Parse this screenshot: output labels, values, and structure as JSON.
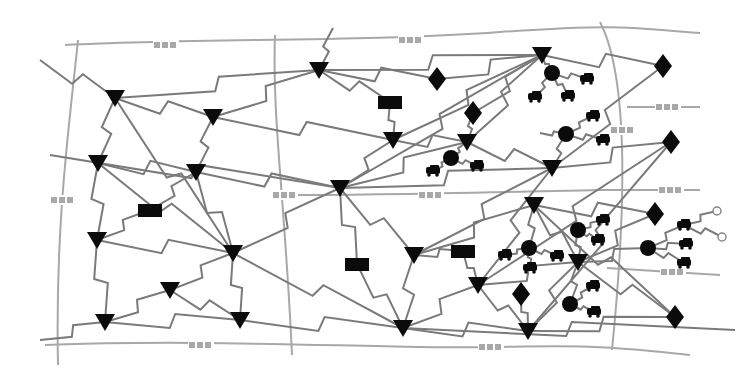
{
  "diagram": {
    "title": "",
    "colors": {
      "background": "#ffffff",
      "road": "#a8a8a8",
      "link": "#7a7a7a",
      "node": "#0b0b0b"
    },
    "legend_symbols": {
      "triangle": "router-node",
      "rectangle": "gateway-node",
      "diamond": "access-point-node",
      "circle": "cluster-head-node",
      "vehicle": "vehicle-node"
    },
    "roads": [
      {
        "id": "r-top",
        "path": "M65 45 C200 38, 360 42, 500 32 S 640 30, 700 33",
        "marks": [
          [
            165,
            45
          ],
          [
            410,
            40
          ]
        ]
      },
      {
        "id": "r-mid",
        "path": "M285 195 C380 195, 460 193, 600 190",
        "marks": [
          [
            430,
            195
          ]
        ]
      },
      {
        "id": "r-bottom",
        "path": "M45 345 C180 340, 300 345, 420 347 S 560 340, 690 355",
        "marks": [
          [
            200,
            345
          ],
          [
            490,
            347
          ]
        ]
      },
      {
        "id": "r-left",
        "path": "M78 40 C70 120, 55 220, 58 365",
        "marks": [
          [
            62,
            200
          ]
        ]
      },
      {
        "id": "r-centerleft",
        "path": "M275 35 C272 120, 285 200, 292 355",
        "marks": [
          [
            284,
            195
          ]
        ]
      },
      {
        "id": "r-right",
        "path": "M600 22 C630 80, 625 220, 612 350",
        "marks": [
          [
            622,
            130
          ]
        ]
      },
      {
        "id": "r-right-spur1",
        "path": "M627 107 L 700 107",
        "marks": [
          [
            667,
            107
          ]
        ]
      },
      {
        "id": "r-right-spur2",
        "path": "M600 190 L 700 190",
        "marks": [
          [
            670,
            190
          ]
        ]
      },
      {
        "id": "r-right-spur3",
        "path": "M607 268 L 720 275",
        "marks": [
          [
            672,
            272
          ]
        ]
      }
    ],
    "nodes": [
      {
        "id": "t1",
        "type": "triangle",
        "x": 115,
        "y": 98
      },
      {
        "id": "t2",
        "type": "triangle",
        "x": 213,
        "y": 117
      },
      {
        "id": "t3",
        "type": "triangle",
        "x": 98,
        "y": 163
      },
      {
        "id": "t4",
        "type": "triangle",
        "x": 196,
        "y": 172
      },
      {
        "id": "t5",
        "type": "triangle",
        "x": 97,
        "y": 240
      },
      {
        "id": "t6",
        "type": "triangle",
        "x": 233,
        "y": 253
      },
      {
        "id": "t7",
        "type": "triangle",
        "x": 170,
        "y": 290
      },
      {
        "id": "t8",
        "type": "triangle",
        "x": 105,
        "y": 322
      },
      {
        "id": "t9",
        "type": "triangle",
        "x": 240,
        "y": 320
      },
      {
        "id": "t10",
        "type": "triangle",
        "x": 319,
        "y": 70
      },
      {
        "id": "t11",
        "type": "triangle",
        "x": 393,
        "y": 140
      },
      {
        "id": "t12",
        "type": "triangle",
        "x": 340,
        "y": 188
      },
      {
        "id": "t13",
        "type": "triangle",
        "x": 542,
        "y": 55
      },
      {
        "id": "t14",
        "type": "triangle",
        "x": 467,
        "y": 142
      },
      {
        "id": "t15",
        "type": "triangle",
        "x": 552,
        "y": 168
      },
      {
        "id": "t16",
        "type": "triangle",
        "x": 534,
        "y": 205
      },
      {
        "id": "t17",
        "type": "triangle",
        "x": 414,
        "y": 255
      },
      {
        "id": "t18",
        "type": "triangle",
        "x": 478,
        "y": 285
      },
      {
        "id": "t19",
        "type": "triangle",
        "x": 403,
        "y": 328
      },
      {
        "id": "t20",
        "type": "triangle",
        "x": 578,
        "y": 262
      },
      {
        "id": "t21",
        "type": "triangle",
        "x": 528,
        "y": 331
      },
      {
        "id": "g1",
        "type": "rectangle",
        "x": 390,
        "y": 102
      },
      {
        "id": "g2",
        "type": "rectangle",
        "x": 150,
        "y": 210
      },
      {
        "id": "g3",
        "type": "rectangle",
        "x": 357,
        "y": 264
      },
      {
        "id": "g4",
        "type": "rectangle",
        "x": 463,
        "y": 251
      },
      {
        "id": "d1",
        "type": "diamond",
        "x": 437,
        "y": 79
      },
      {
        "id": "d2",
        "type": "diamond",
        "x": 473,
        "y": 113
      },
      {
        "id": "d3",
        "type": "diamond",
        "x": 663,
        "y": 66
      },
      {
        "id": "d4",
        "type": "diamond",
        "x": 671,
        "y": 142
      },
      {
        "id": "d5",
        "type": "diamond",
        "x": 655,
        "y": 214
      },
      {
        "id": "d6",
        "type": "diamond",
        "x": 521,
        "y": 294
      },
      {
        "id": "d7",
        "type": "diamond",
        "x": 675,
        "y": 317
      },
      {
        "id": "c1",
        "type": "circle",
        "x": 552,
        "y": 73
      },
      {
        "id": "c2",
        "type": "circle",
        "x": 451,
        "y": 158
      },
      {
        "id": "c3",
        "type": "circle",
        "x": 566,
        "y": 134
      },
      {
        "id": "c4",
        "type": "circle",
        "x": 529,
        "y": 248
      },
      {
        "id": "c5",
        "type": "circle",
        "x": 578,
        "y": 230
      },
      {
        "id": "c6",
        "type": "circle",
        "x": 648,
        "y": 248
      },
      {
        "id": "c7",
        "type": "circle",
        "x": 570,
        "y": 304
      },
      {
        "id": "v1",
        "type": "vehicle",
        "x": 587,
        "y": 79
      },
      {
        "id": "v2",
        "type": "vehicle",
        "x": 535,
        "y": 97
      },
      {
        "id": "v3",
        "type": "vehicle",
        "x": 568,
        "y": 96
      },
      {
        "id": "v4",
        "type": "vehicle",
        "x": 433,
        "y": 171
      },
      {
        "id": "v5",
        "type": "vehicle",
        "x": 477,
        "y": 166
      },
      {
        "id": "v6",
        "type": "vehicle",
        "x": 593,
        "y": 116
      },
      {
        "id": "v7",
        "type": "vehicle",
        "x": 603,
        "y": 140
      },
      {
        "id": "v8",
        "type": "vehicle",
        "x": 505,
        "y": 255
      },
      {
        "id": "v9",
        "type": "vehicle",
        "x": 557,
        "y": 256
      },
      {
        "id": "v10",
        "type": "vehicle",
        "x": 530,
        "y": 268
      },
      {
        "id": "v11",
        "type": "vehicle",
        "x": 603,
        "y": 220
      },
      {
        "id": "v12",
        "type": "vehicle",
        "x": 598,
        "y": 240
      },
      {
        "id": "v13",
        "type": "vehicle",
        "x": 684,
        "y": 225
      },
      {
        "id": "v14",
        "type": "vehicle",
        "x": 686,
        "y": 244
      },
      {
        "id": "v15",
        "type": "vehicle",
        "x": 684,
        "y": 263
      },
      {
        "id": "v16",
        "type": "vehicle",
        "x": 593,
        "y": 286
      },
      {
        "id": "v17",
        "type": "vehicle",
        "x": 594,
        "y": 312
      }
    ],
    "endpoints": [
      {
        "id": "e1",
        "x": 717,
        "y": 211
      },
      {
        "id": "e2",
        "x": 722,
        "y": 237
      }
    ],
    "links": [
      [
        "ext-a",
        "t1",
        40,
        60
      ],
      [
        "t1",
        "t10",
        0,
        0
      ],
      [
        "t1",
        "t2",
        0,
        0
      ],
      [
        "t1",
        "t3",
        0,
        0
      ],
      [
        "t1",
        "t6",
        0,
        0
      ],
      [
        "t2",
        "t10",
        0,
        0
      ],
      [
        "t2",
        "t4",
        0,
        0
      ],
      [
        "t2",
        "t11",
        0,
        0
      ],
      [
        "t3",
        "t4",
        0,
        0
      ],
      [
        "t3",
        "t5",
        0,
        0
      ],
      [
        "t3",
        "t6",
        0,
        0
      ],
      [
        "t4",
        "t6",
        0,
        0
      ],
      [
        "t4",
        "g2",
        0,
        0
      ],
      [
        "t4",
        "t12",
        0,
        0
      ],
      [
        "t5",
        "g2",
        0,
        0
      ],
      [
        "t5",
        "t6",
        0,
        0
      ],
      [
        "t5",
        "t8",
        0,
        0
      ],
      [
        "t6",
        "t7",
        0,
        0
      ],
      [
        "t6",
        "t9",
        0,
        0
      ],
      [
        "t6",
        "t12",
        0,
        0
      ],
      [
        "t6",
        "t19",
        0,
        0
      ],
      [
        "t7",
        "t8",
        0,
        0
      ],
      [
        "t7",
        "t9",
        0,
        0
      ],
      [
        "t8",
        "t9",
        0,
        0
      ],
      [
        "ext-b",
        "t8",
        40,
        340
      ],
      [
        "t9",
        "t19",
        0,
        0
      ],
      [
        "ext-c",
        "t10",
        333,
        28
      ],
      [
        "t10",
        "d1",
        0,
        0
      ],
      [
        "t10",
        "g1",
        0,
        0
      ],
      [
        "t10",
        "t13",
        0,
        0
      ],
      [
        "g1",
        "t11",
        0,
        0
      ],
      [
        "t11",
        "t14",
        0,
        0
      ],
      [
        "t11",
        "t12",
        0,
        0
      ],
      [
        "t11",
        "t13",
        0,
        0
      ],
      [
        "ext-d",
        "t12",
        50,
        155
      ],
      [
        "t12",
        "t13",
        0,
        0
      ],
      [
        "t12",
        "t14",
        0,
        0
      ],
      [
        "t12",
        "g3",
        0,
        0
      ],
      [
        "t12",
        "t17",
        0,
        0
      ],
      [
        "g3",
        "t19",
        0,
        0
      ],
      [
        "d1",
        "t13",
        0,
        0
      ],
      [
        "d2",
        "t14",
        0,
        0
      ],
      [
        "d2",
        "t13",
        0,
        0
      ],
      [
        "t13",
        "d3",
        0,
        0
      ],
      [
        "t13",
        "c1",
        0,
        0
      ],
      [
        "t13",
        "t14",
        0,
        0
      ],
      [
        "t14",
        "c2",
        0,
        0
      ],
      [
        "t14",
        "t15",
        0,
        0
      ],
      [
        "t15",
        "c3",
        0,
        0
      ],
      [
        "t15",
        "d4",
        0,
        0
      ],
      [
        "t15",
        "t17",
        0,
        0
      ],
      [
        "t15",
        "t18",
        0,
        0
      ],
      [
        "t12",
        "t15",
        0,
        0
      ],
      [
        "t16",
        "t17",
        0,
        0
      ],
      [
        "t16",
        "c4",
        0,
        0
      ],
      [
        "t16",
        "t20",
        0,
        0
      ],
      [
        "t16",
        "d5",
        0,
        0
      ],
      [
        "t17",
        "g4",
        0,
        0
      ],
      [
        "t17",
        "t19",
        0,
        0
      ],
      [
        "g4",
        "t18",
        0,
        0
      ],
      [
        "t18",
        "t19",
        0,
        0
      ],
      [
        "t18",
        "t20",
        0,
        0
      ],
      [
        "t18",
        "t21",
        0,
        0
      ],
      [
        "t19",
        "t21",
        0,
        0
      ],
      [
        "t19",
        "ext-e",
        735,
        330
      ],
      [
        "t20",
        "c5",
        0,
        0
      ],
      [
        "t20",
        "d5",
        0,
        0
      ],
      [
        "t20",
        "c6",
        0,
        0
      ],
      [
        "t20",
        "d7",
        0,
        0
      ],
      [
        "t20",
        "t21",
        0,
        0
      ],
      [
        "t20",
        "c7",
        0,
        0
      ],
      [
        "d6",
        "t21",
        0,
        0
      ],
      [
        "t21",
        "d7",
        0,
        0
      ],
      [
        "d3",
        "t15",
        0,
        0
      ],
      [
        "d4",
        "t21",
        0,
        0
      ],
      [
        "d4",
        "t18",
        0,
        0
      ],
      [
        "t16",
        "d7",
        0,
        0
      ],
      [
        "c1",
        "v1",
        0,
        0
      ],
      [
        "c1",
        "v2",
        0,
        0
      ],
      [
        "c1",
        "v3",
        0,
        0
      ],
      [
        "c2",
        "v4",
        0,
        0
      ],
      [
        "c2",
        "v5",
        0,
        0
      ],
      [
        "c3",
        "v6",
        0,
        0
      ],
      [
        "c3",
        "v7",
        0,
        0
      ],
      [
        "c3",
        "ext-f",
        540,
        133
      ],
      [
        "c4",
        "v8",
        0,
        0
      ],
      [
        "c4",
        "v9",
        0,
        0
      ],
      [
        "c4",
        "v10",
        0,
        0
      ],
      [
        "c5",
        "v11",
        0,
        0
      ],
      [
        "c5",
        "v12",
        0,
        0
      ],
      [
        "c6",
        "v13",
        0,
        0
      ],
      [
        "c6",
        "v14",
        0,
        0
      ],
      [
        "c6",
        "v15",
        0,
        0
      ],
      [
        "v13",
        "e1",
        0,
        0
      ],
      [
        "v13",
        "e2",
        0,
        0
      ],
      [
        "c7",
        "v16",
        0,
        0
      ],
      [
        "c7",
        "v17",
        0,
        0
      ]
    ]
  }
}
